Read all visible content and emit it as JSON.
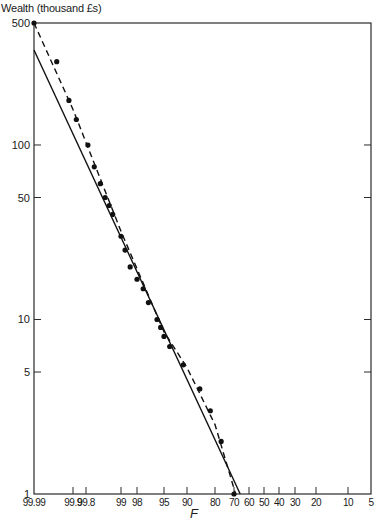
{
  "chart_data": {
    "type": "scatter",
    "title": "",
    "ylabel": "Wealth (thousand £s)",
    "xlabel": "F",
    "yscale": "log",
    "xscale": "probability (descending)",
    "ylim": [
      1,
      500
    ],
    "xlim": [
      99.99,
      5
    ],
    "y_ticks": [
      1,
      5,
      10,
      50,
      100,
      500
    ],
    "x_ticks": [
      "99.99",
      "99.9",
      "99.8",
      "99",
      "98",
      "95",
      "90",
      "80",
      "70",
      "60",
      "50",
      "40",
      "30",
      "20",
      "10",
      "5"
    ],
    "grid": false,
    "legend": null,
    "series": [
      {
        "name": "Observed data",
        "style": "points",
        "points": [
          {
            "F": 99.99,
            "wealth": 500
          },
          {
            "F": 99.96,
            "wealth": 300
          },
          {
            "F": 99.92,
            "wealth": 180
          },
          {
            "F": 99.88,
            "wealth": 140
          },
          {
            "F": 99.78,
            "wealth": 100
          },
          {
            "F": 99.7,
            "wealth": 75
          },
          {
            "F": 99.6,
            "wealth": 60
          },
          {
            "F": 99.5,
            "wealth": 50
          },
          {
            "F": 99.4,
            "wealth": 45
          },
          {
            "F": 99.3,
            "wealth": 40
          },
          {
            "F": 99.0,
            "wealth": 30
          },
          {
            "F": 98.8,
            "wealth": 25
          },
          {
            "F": 98.5,
            "wealth": 20
          },
          {
            "F": 98.0,
            "wealth": 17
          },
          {
            "F": 97.5,
            "wealth": 15
          },
          {
            "F": 97.0,
            "wealth": 12.5
          },
          {
            "F": 96.0,
            "wealth": 10
          },
          {
            "F": 95.5,
            "wealth": 9
          },
          {
            "F": 95.0,
            "wealth": 8
          },
          {
            "F": 94.0,
            "wealth": 7
          },
          {
            "F": 91.0,
            "wealth": 5.5
          },
          {
            "F": 86.0,
            "wealth": 4
          },
          {
            "F": 82.0,
            "wealth": 3
          },
          {
            "F": 77.0,
            "wealth": 2
          },
          {
            "F": 70.0,
            "wealth": 1
          }
        ]
      },
      {
        "name": "Fitted (solid line)",
        "style": "solid",
        "points": [
          {
            "F": 99.99,
            "wealth": 350
          },
          {
            "F": 66.0,
            "wealth": 1
          }
        ]
      },
      {
        "name": "Fitted (dashed curve)",
        "style": "dashed",
        "points": [
          {
            "F": 99.99,
            "wealth": 500
          },
          {
            "F": 99.9,
            "wealth": 160
          },
          {
            "F": 99.0,
            "wealth": 32
          },
          {
            "F": 95.0,
            "wealth": 8.5
          },
          {
            "F": 90.0,
            "wealth": 5.3
          },
          {
            "F": 80.0,
            "wealth": 2.5
          },
          {
            "F": 69.0,
            "wealth": 1
          }
        ]
      }
    ]
  },
  "plot_px": {
    "left": 34,
    "right": 371,
    "top": 23,
    "bottom": 494,
    "y_log_min": 0,
    "y_log_max": 2.69897,
    "x_tick_px": {
      "99.99": 34,
      "99.9": 73,
      "99.8": 86,
      "99": 121,
      "98": 137,
      "95": 164,
      "90": 187,
      "80": 215,
      "70": 234,
      "60": 249,
      "50": 264,
      "40": 279,
      "30": 295,
      "20": 316,
      "10": 348,
      "5": 371
    }
  },
  "labels": {
    "y_title": "Wealth (thousand £s)",
    "x_var": "F"
  }
}
